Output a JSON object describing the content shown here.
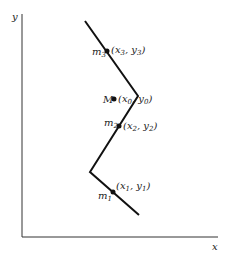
{
  "axes": {
    "x_label": "x",
    "y_label": "y"
  },
  "points": [
    {
      "mass": "m",
      "mass_sub": "3",
      "coord": "(x",
      "coord_sub1": "3",
      "coord_mid": ", y",
      "coord_sub2": "3",
      "coord_end": ")"
    },
    {
      "mass": "M",
      "coord": "(x",
      "coord_sub1": "0",
      "coord_mid": ", y",
      "coord_sub2": "0",
      "coord_end": ")"
    },
    {
      "mass": "m",
      "mass_sub": "2",
      "coord": "(x",
      "coord_sub1": "2",
      "coord_mid": ", y",
      "coord_sub2": "2",
      "coord_end": ")"
    },
    {
      "mass": "m",
      "mass_sub": "1",
      "coord": "(x",
      "coord_sub1": "1",
      "coord_mid": ", y",
      "coord_sub2": "1",
      "coord_end": ")"
    }
  ]
}
